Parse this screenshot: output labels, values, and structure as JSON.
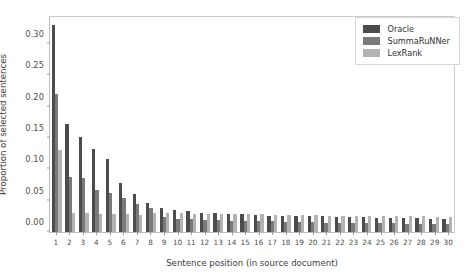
{
  "chart_data": {
    "type": "bar",
    "title": "",
    "xlabel": "Sentence position (in source document)",
    "ylabel": "Proportion of selected sentences",
    "categories": [
      "1",
      "2",
      "3",
      "4",
      "5",
      "6",
      "7",
      "8",
      "9",
      "10",
      "11",
      "12",
      "13",
      "14",
      "15",
      "16",
      "17",
      "18",
      "19",
      "20",
      "21",
      "22",
      "23",
      "24",
      "25",
      "26",
      "27",
      "28",
      "29",
      "30"
    ],
    "series": [
      {
        "name": "Oracle",
        "color": "#4c4c4c",
        "values": [
          0.33,
          0.172,
          0.152,
          0.133,
          0.116,
          0.078,
          0.06,
          0.047,
          0.038,
          0.035,
          0.033,
          0.031,
          0.03,
          0.029,
          0.028,
          0.027,
          0.026,
          0.026,
          0.025,
          0.025,
          0.025,
          0.024,
          0.024,
          0.024,
          0.023,
          0.023,
          0.022,
          0.022,
          0.021,
          0.021
        ]
      },
      {
        "name": "SummaRuNNer",
        "color": "#7a7a7a",
        "values": [
          0.22,
          0.088,
          0.086,
          0.067,
          0.062,
          0.054,
          0.045,
          0.038,
          0.024,
          0.021,
          0.02,
          0.019,
          0.019,
          0.018,
          0.018,
          0.017,
          0.017,
          0.016,
          0.016,
          0.016,
          0.015,
          0.015,
          0.015,
          0.014,
          0.014,
          0.014,
          0.013,
          0.013,
          0.013,
          0.012
        ]
      },
      {
        "name": "LexRank",
        "color": "#b3b3b3",
        "values": [
          0.13,
          0.03,
          0.03,
          0.029,
          0.028,
          0.028,
          0.027,
          0.031,
          0.03,
          0.03,
          0.029,
          0.029,
          0.029,
          0.028,
          0.028,
          0.028,
          0.027,
          0.027,
          0.027,
          0.027,
          0.026,
          0.026,
          0.026,
          0.026,
          0.025,
          0.025,
          0.025,
          0.025,
          0.024,
          0.024
        ]
      }
    ],
    "yticks": [
      "0.00",
      "0.05",
      "0.10",
      "0.15",
      "0.20",
      "0.25",
      "0.30"
    ],
    "ytick_values": [
      0.0,
      0.05,
      0.1,
      0.15,
      0.2,
      0.25,
      0.3
    ],
    "ylim": [
      0.0,
      0.3428
    ],
    "xlim_labels": [
      "1",
      "30"
    ],
    "grid": false,
    "legend_position": "top-right"
  },
  "legend": {
    "entries": [
      {
        "label": "Oracle"
      },
      {
        "label": "SummaRuNNer"
      },
      {
        "label": "LexRank"
      }
    ]
  }
}
